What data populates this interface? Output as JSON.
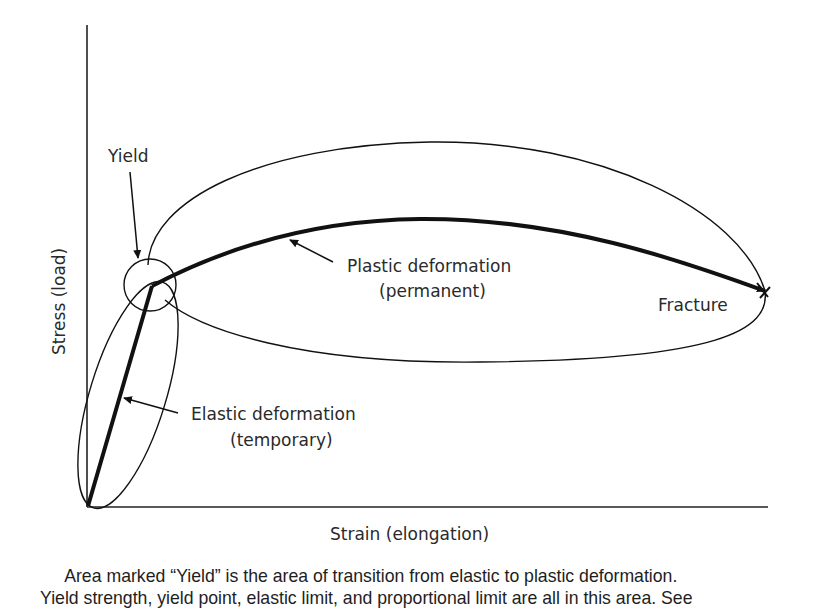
{
  "diagram": {
    "y_axis_label": "Stress (load)",
    "x_axis_label": "Strain (elongation)",
    "labels": {
      "yield": "Yield",
      "plastic_line1": "Plastic deformation",
      "plastic_line2": "(permanent)",
      "elastic_line1": "Elastic deformation",
      "elastic_line2": "(temporary)",
      "fracture": "Fracture"
    },
    "colors": {
      "ink": "#111111",
      "text": "#2a2a2a",
      "background": "#ffffff"
    }
  },
  "caption": {
    "line1": "Area marked “Yield” is the area of transition from elastic to plastic deformation.",
    "line2": "Yield strength, yield point, elastic limit, and proportional limit are all in this area. See"
  }
}
